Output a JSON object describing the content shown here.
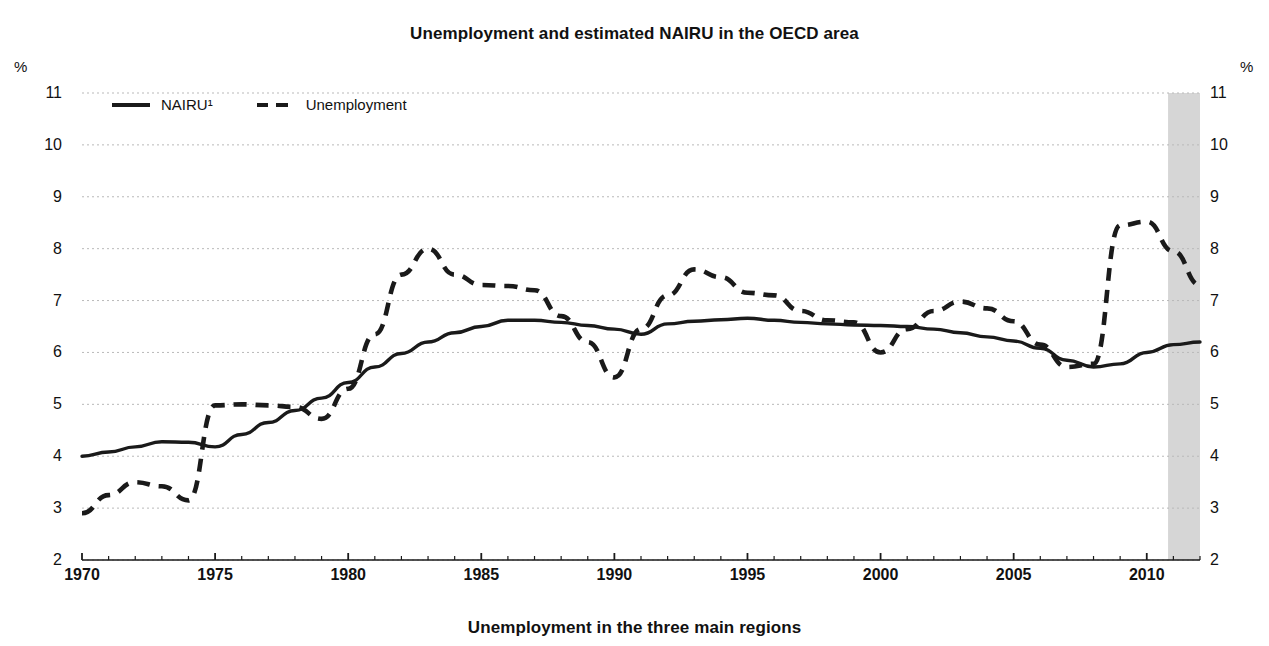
{
  "figure": {
    "title": "Unemployment and estimated NAIRU in the OECD area",
    "bottom_caption": "Unemployment in the three main regions",
    "cut_fragment": "",
    "unit_left": "%",
    "unit_right": "%"
  },
  "legend": {
    "items": [
      {
        "label": "NAIRU¹",
        "style": "solid"
      },
      {
        "label": "Unemployment",
        "style": "dashed"
      }
    ]
  },
  "chart_data": {
    "type": "line",
    "title": "Unemployment and estimated NAIRU in the OECD area",
    "xlabel": "",
    "ylabel": "%",
    "xlim": [
      1970,
      2012
    ],
    "ylim": [
      2,
      11
    ],
    "grid": true,
    "legend_position": "top-left",
    "y_ticks": [
      11,
      10,
      9,
      8,
      7,
      6,
      5,
      4,
      3,
      2
    ],
    "x_ticks": [
      1970,
      1975,
      1980,
      1985,
      1990,
      1995,
      2000,
      2005,
      2010
    ],
    "x_minor_tick_interval": 1,
    "shaded_region": {
      "label": "projection",
      "from": 2010.8,
      "to": 2012.5,
      "color": "#c8c8c8"
    },
    "x": [
      1970,
      1971,
      1972,
      1973,
      1974,
      1975,
      1976,
      1977,
      1978,
      1979,
      1980,
      1981,
      1982,
      1983,
      1984,
      1985,
      1986,
      1987,
      1988,
      1989,
      1990,
      1991,
      1992,
      1993,
      1994,
      1995,
      1996,
      1997,
      1998,
      1999,
      2000,
      2001,
      2002,
      2003,
      2004,
      2005,
      2006,
      2007,
      2008,
      2009,
      2010,
      2011,
      2012
    ],
    "series": [
      {
        "name": "NAIRU¹",
        "style": "solid",
        "color": "#1a1a1a",
        "values": [
          4.0,
          4.08,
          4.18,
          4.28,
          4.27,
          4.18,
          4.42,
          4.65,
          4.88,
          5.12,
          5.42,
          5.72,
          5.98,
          6.2,
          6.38,
          6.5,
          6.62,
          6.62,
          6.58,
          6.52,
          6.45,
          6.35,
          6.55,
          6.6,
          6.63,
          6.66,
          6.62,
          6.58,
          6.55,
          6.53,
          6.52,
          6.5,
          6.45,
          6.38,
          6.3,
          6.22,
          6.08,
          5.85,
          5.72,
          5.78,
          6.0,
          6.15,
          6.2
        ]
      },
      {
        "name": "Unemployment",
        "style": "dashed",
        "color": "#1a1a1a",
        "values": [
          2.9,
          3.25,
          3.5,
          3.42,
          3.15,
          4.98,
          5.0,
          4.98,
          4.95,
          4.72,
          5.3,
          6.35,
          7.5,
          8.0,
          7.5,
          7.3,
          7.28,
          7.2,
          6.7,
          6.2,
          5.52,
          6.45,
          7.1,
          7.6,
          7.45,
          7.15,
          7.1,
          6.8,
          6.62,
          6.58,
          6.0,
          6.45,
          6.8,
          6.98,
          6.85,
          6.6,
          6.15,
          5.72,
          5.78,
          8.45,
          8.52,
          7.95,
          7.3
        ]
      }
    ]
  }
}
